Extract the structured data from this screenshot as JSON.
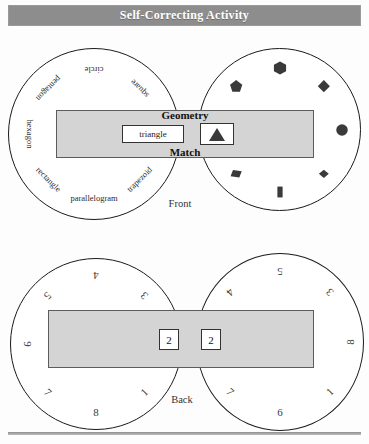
{
  "banner": {
    "title": "Self-Correcting Activity"
  },
  "front": {
    "caption": "Front",
    "bar": {
      "top_label": "Geometry",
      "bottom_label": "Match",
      "word_window": "triangle",
      "shape_window_icon": "triangle-glyph"
    },
    "left_wheel": {
      "name": "shape-name-wheel",
      "labels": [
        {
          "text": "circle",
          "angle": 0
        },
        {
          "text": "square",
          "angle": 45
        },
        {
          "text": "trapezoid",
          "angle": 135
        },
        {
          "text": "parallelogram",
          "angle": 180
        },
        {
          "text": "rectangle",
          "angle": 225
        },
        {
          "text": "hexagon",
          "angle": 270
        },
        {
          "text": "pentagon",
          "angle": 315
        }
      ]
    },
    "right_wheel": {
      "name": "shape-figure-wheel",
      "glyphs": [
        {
          "icon": "hexagon-glyph",
          "angle": 0
        },
        {
          "icon": "diamond-glyph",
          "angle": 45
        },
        {
          "icon": "circle-glyph",
          "angle": 90
        },
        {
          "icon": "diamond-small-glyph",
          "angle": 135
        },
        {
          "icon": "rectangle-glyph",
          "angle": 180
        },
        {
          "icon": "parallelogram-glyph",
          "angle": 225
        },
        {
          "icon": "pentagon-glyph",
          "angle": 315
        }
      ]
    }
  },
  "back": {
    "caption": "Back",
    "bar": {
      "left_window": "2",
      "right_window": "2"
    },
    "left_wheel": {
      "name": "answer-number-wheel-left",
      "numbers": [
        {
          "text": "4",
          "angle": 0
        },
        {
          "text": "3",
          "angle": 45
        },
        {
          "text": "1",
          "angle": 135
        },
        {
          "text": "8",
          "angle": 180
        },
        {
          "text": "7",
          "angle": 225
        },
        {
          "text": "9",
          "angle": 270
        },
        {
          "text": "5",
          "angle": 315
        }
      ]
    },
    "right_wheel": {
      "name": "answer-number-wheel-right",
      "numbers": [
        {
          "text": "5",
          "angle": 0
        },
        {
          "text": "3",
          "angle": 45
        },
        {
          "text": "8",
          "angle": 90
        },
        {
          "text": "1",
          "angle": 135
        },
        {
          "text": "6",
          "angle": 180
        },
        {
          "text": "7",
          "angle": 225
        },
        {
          "text": "4",
          "angle": 315
        }
      ]
    }
  },
  "colors": {
    "banner_bg": "#8d8d8d",
    "bar_fill": "#d4d4d4",
    "ink": "#1a1a1a",
    "glyph": "#3a3a3a"
  }
}
